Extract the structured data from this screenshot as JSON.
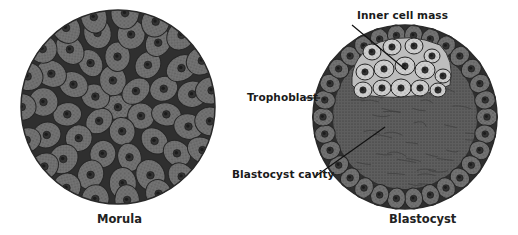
{
  "figures": [
    {
      "id": "morula",
      "caption": "Morula",
      "center": [
        118,
        107
      ],
      "radius": 97
    },
    {
      "id": "blastocyst",
      "caption": "Blastocyst",
      "center": [
        405,
        117
      ],
      "radius": 92,
      "labels": {
        "inner_cell_mass": "Inner cell mass",
        "trophoblast": "Trophoblast",
        "blastocyst_cavity": "Blastocyst cavity"
      }
    }
  ],
  "colors": {
    "cell_fill": "#6e6e6e",
    "cell_border": "#2a2a2a",
    "nucleus": "#2e2e2e",
    "inner_mass_fill": "#c8c8c8",
    "cavity_fill": "#5c5c5c",
    "background": "#ffffff"
  }
}
